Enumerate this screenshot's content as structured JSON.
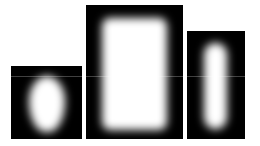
{
  "image": {
    "description": "Three black panels each containing a blurred white shape",
    "background": "#ffffff",
    "panels": [
      {
        "name": "blob-panel",
        "shape": "rounded teardrop / egg blob"
      },
      {
        "name": "rectangle-panel",
        "shape": "rounded rectangle"
      },
      {
        "name": "capsule-panel",
        "shape": "vertical capsule / pill"
      }
    ]
  }
}
